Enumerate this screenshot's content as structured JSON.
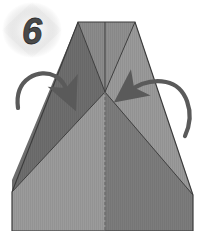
{
  "figure": {
    "kind": "origami-fold-diagram",
    "width": 204,
    "height": 231,
    "background_color": "#ffffff"
  },
  "step_badge": {
    "number": "6",
    "text_color": "#4a4a4a",
    "glow_color": "#d8d8d8",
    "center_x": 32,
    "center_y": 30
  },
  "paper": {
    "outline_color": "#3c3c3c",
    "top_edge": {
      "left_x": 78,
      "right_x": 135,
      "y": 22
    },
    "left_corner": {
      "x": 12,
      "y": 192
    },
    "right_corner": {
      "x": 193,
      "y": 195
    },
    "bottom_y": 231,
    "center_vertex": {
      "x": 105,
      "y": 92
    },
    "facets": [
      {
        "name": "upper-left-flap",
        "color": "#6e6e6e",
        "label": "dark upper left triangular flap"
      },
      {
        "name": "upper-center-band",
        "color": "#8d8d8d",
        "label": "mid upper center band"
      },
      {
        "name": "upper-right-flap",
        "color": "#9a9a9a",
        "label": "light upper right triangular flap"
      },
      {
        "name": "left-wing",
        "color": "#747474",
        "label": "dark left wing"
      },
      {
        "name": "right-wing",
        "color": "#8a8a8a",
        "label": "right wing"
      },
      {
        "name": "lower-left-panel",
        "color": "#9b9b9b",
        "label": "light lower left panel"
      },
      {
        "name": "lower-right-panel",
        "color": "#7c7c7c",
        "label": "dark lower right panel"
      }
    ],
    "center_crease": {
      "color": "#6a6a6a",
      "style": "dashed-vertical"
    }
  },
  "arrows": [
    {
      "name": "left-fold-arrow",
      "direction": "inward-right",
      "color": "#5a5a5a",
      "tip_x": 69,
      "tip_y": 97,
      "label": "fold left flap toward center"
    },
    {
      "name": "right-fold-arrow",
      "direction": "inward-left",
      "color": "#5a5a5a",
      "tip_x": 126,
      "tip_y": 92,
      "label": "fold right flap toward center"
    }
  ]
}
